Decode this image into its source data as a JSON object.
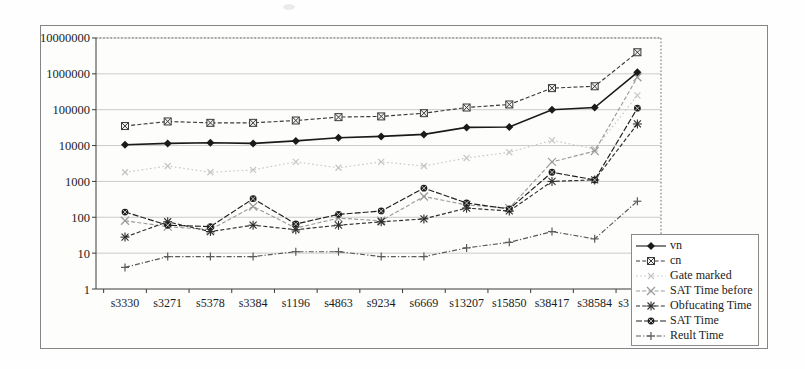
{
  "chart_data": {
    "type": "line",
    "title": "",
    "y_axis": {
      "scale": "log",
      "min": 1,
      "max": 10000000,
      "tick_labels": [
        "1",
        "10",
        "100",
        "1000",
        "10000",
        "100000",
        "1000000",
        "10000000"
      ]
    },
    "x_categories": [
      "s3330",
      "s3271",
      "s5378",
      "s3384",
      "s1196",
      "s4863",
      "s9234",
      "s6669",
      "s13207",
      "s15850",
      "s38417",
      "s38584",
      "s3"
    ],
    "legend_position": "right-bottom-overlay",
    "grid": "horizontal-decades",
    "series": [
      {
        "name": "Gate marked",
        "marker": "light-x",
        "line": "dotted",
        "color": "#c6c6c4",
        "values": [
          1800,
          2700,
          1800,
          2100,
          3500,
          2400,
          3500,
          2700,
          4500,
          6500,
          14000,
          8000,
          250000
        ]
      },
      {
        "name": "SAT Time before",
        "marker": "x",
        "line": "dashed",
        "color": "#9b9b99",
        "values": [
          80,
          55,
          45,
          200,
          50,
          95,
          80,
          380,
          220,
          180,
          3500,
          7000,
          800000
        ]
      },
      {
        "name": "Reult Time",
        "marker": "plus",
        "line": "dash-dot",
        "color": "#5a5a5a",
        "values": [
          4,
          8,
          8,
          8,
          11,
          11,
          8,
          8,
          14,
          20,
          40,
          25,
          280
        ]
      },
      {
        "name": "cn",
        "marker": "boxed-x",
        "line": "dashed",
        "color": "#3a3a3a",
        "values": [
          35000,
          47000,
          43000,
          43000,
          50000,
          62000,
          65000,
          80000,
          115000,
          140000,
          400000,
          450000,
          4000000
        ]
      },
      {
        "name": "Obfucating Time",
        "marker": "asterisk",
        "line": "dashed",
        "color": "#2e2e2e",
        "values": [
          28,
          75,
          40,
          60,
          45,
          60,
          75,
          90,
          180,
          150,
          1000,
          1100,
          40000
        ]
      },
      {
        "name": "SAT Time",
        "marker": "circle-x",
        "line": "long-dash",
        "color": "#1f1f1f",
        "values": [
          140,
          60,
          55,
          330,
          65,
          120,
          150,
          650,
          250,
          170,
          1800,
          1100,
          110000
        ]
      },
      {
        "name": "vn",
        "marker": "filled-diamond",
        "line": "solid",
        "color": "#1a1a1a",
        "values": [
          10500,
          11500,
          12000,
          11500,
          13500,
          16500,
          18000,
          20500,
          32000,
          33000,
          100000,
          115000,
          1100000
        ]
      }
    ],
    "legend_order": [
      "vn",
      "cn",
      "Gate marked",
      "SAT Time before",
      "Obfucating Time",
      "SAT Time",
      "Reult Time"
    ]
  }
}
